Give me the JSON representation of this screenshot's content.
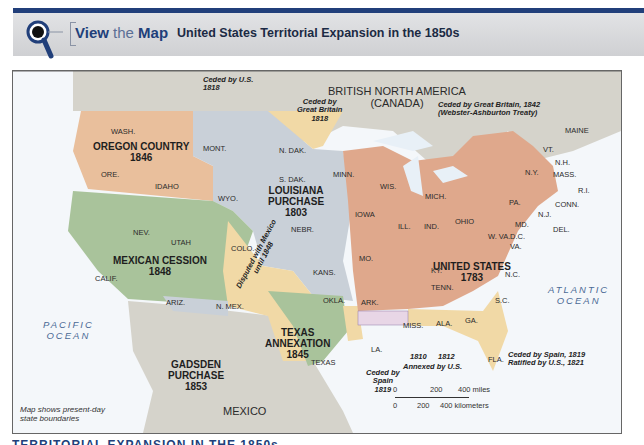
{
  "header": {
    "view_the": "View",
    "the": " the ",
    "map": "Map",
    "title": "United States Territorial Expansion in the 1850s",
    "icon": "magnifier-icon",
    "accent_color": "#213f7a"
  },
  "map": {
    "countries": {
      "british_north_america": "BRITISH NORTH AMERICA",
      "canada": "(CANADA)",
      "mexico": "MEXICO"
    },
    "oceans": {
      "pacific_1": "PACIFIC",
      "pacific_2": "OCEAN",
      "atlantic_1": "ATLANTIC",
      "atlantic_2": "OCEAN"
    },
    "regions": [
      {
        "name": "OREGON COUNTRY",
        "year": "1846",
        "color": "#e9bf9c"
      },
      {
        "name": "LOUISIANA",
        "name2": "PURCHASE",
        "year": "1803",
        "color": "#c9d0d8"
      },
      {
        "name": "MEXICAN CESSION",
        "year": "1848",
        "color": "#a9c39b"
      },
      {
        "name": "TEXAS",
        "name2": "ANNEXATION",
        "year": "1845",
        "color": "#a9c39b"
      },
      {
        "name": "GADSDEN",
        "name2": "PURCHASE",
        "year": "1853",
        "color": "#c9d0d8"
      },
      {
        "name": "UNITED STATES",
        "year": "1783",
        "color": "#dfa88c"
      }
    ],
    "states": [
      "WASH.",
      "ORE.",
      "IDAHO",
      "MONT.",
      "WYO.",
      "N. DAK.",
      "S. DAK.",
      "NEBR.",
      "IOWA",
      "MINN.",
      "WIS.",
      "MICH.",
      "NEV.",
      "UTAH",
      "CALIF.",
      "ARIZ.",
      "COLO.",
      "N. MEX.",
      "KANS.",
      "MO.",
      "OKLA.",
      "ARK.",
      "TEXAS",
      "LA.",
      "ILL.",
      "IND.",
      "OHIO",
      "KY.",
      "TENN.",
      "MISS.",
      "ALA.",
      "GA.",
      "FLA.",
      "S.C.",
      "N.C.",
      "VA.",
      "W. VA.",
      "D.C.",
      "MD.",
      "DEL.",
      "N.J.",
      "PA.",
      "N.Y.",
      "CONN.",
      "R.I.",
      "MASS.",
      "N.H.",
      "VT.",
      "MAINE"
    ],
    "annotations": {
      "ceded_us_1818_a": "Ceded by U.S.",
      "ceded_us_1818_b": "1818",
      "ceded_gb_1818_a": "Ceded by",
      "ceded_gb_1818_b": "Great Britain",
      "ceded_gb_1818_c": "1818",
      "ceded_gb_1842_a": "Ceded by Great Britain, 1842",
      "ceded_gb_1842_b": "(Webster-Ashburton Treaty)",
      "disputed_a": "Disputed with Mexico",
      "disputed_b": "until 1848",
      "ceded_spain_1819_a": "Ceded by",
      "ceded_spain_1819_b": "Spain",
      "ceded_spain_1819_c": "1819",
      "annexed_1810": "1810",
      "annexed_1812": "1812",
      "annexed_by_us": "Annexed by U.S.",
      "fla_a": "Ceded by Spain, 1819",
      "fla_b": "Ratified by U.S., 1821"
    },
    "note_a": "Map shows present-day",
    "note_b": "state boundaries",
    "scale": {
      "miles": [
        "0",
        "200",
        "400 miles"
      ],
      "km": [
        "0",
        "200",
        "400 kilometers"
      ]
    },
    "colors": {
      "water": "#eef4f9",
      "foreign_land": "#d5d3cb",
      "ceded_tan": "#f1d9a6"
    }
  },
  "footer": {
    "text": "TERRITORIAL EXPANSION IN THE 1850s"
  }
}
